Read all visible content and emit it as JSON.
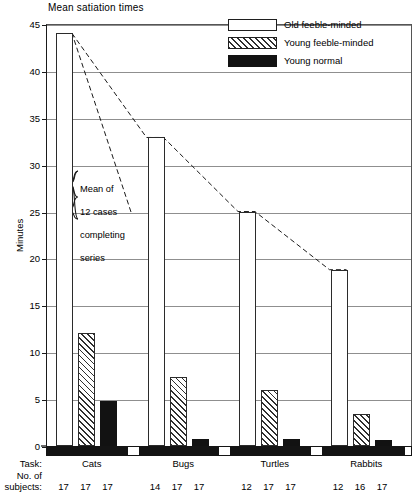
{
  "chart_data": {
    "type": "bar",
    "title": "Mean satiation times",
    "xlabel": "Task:",
    "ylabel": "Minutes",
    "ylim": [
      0,
      45
    ],
    "ytick_step": 5,
    "yticks": [
      "0",
      "5",
      "10",
      "15",
      "20",
      "25",
      "30",
      "35",
      "40",
      "45"
    ],
    "grid": true,
    "legend_position": "top-right",
    "categories": [
      "Cats",
      "Bugs",
      "Turtles",
      "Rabbits"
    ],
    "series": [
      {
        "name": "Old feeble-minded",
        "key": "old",
        "values": [
          44.0,
          32.9,
          25.0,
          18.8
        ],
        "subjects": [
          17,
          14,
          12,
          12
        ]
      },
      {
        "name": "Young feeble-minded",
        "key": "young-fm",
        "values": [
          12.1,
          7.4,
          6.0,
          3.4
        ],
        "subjects": [
          17,
          17,
          17,
          16
        ]
      },
      {
        "name": "Young normal",
        "key": "young-norm",
        "values": [
          4.8,
          0.8,
          0.8,
          0.6
        ],
        "subjects": [
          17,
          17,
          17,
          17
        ]
      }
    ],
    "annotations": [
      {
        "text": "Mean of\n12 cases\ncompleting\nseries",
        "points_to": "trend-line"
      }
    ],
    "trend_line": {
      "style": "dashed",
      "connects": "Old feeble-minded bar tops",
      "values": [
        44.0,
        32.9,
        25.0,
        18.8
      ]
    }
  },
  "axis": {
    "task_row_label": "Task:",
    "subjects_row_label_line1": "No. of",
    "subjects_row_label_line2": "subjects:"
  },
  "legend": {
    "items": [
      {
        "label": "Old feeble-minded",
        "swatch": "white-outline"
      },
      {
        "label": "Young feeble-minded",
        "swatch": "hatched"
      },
      {
        "label": "Young normal",
        "swatch": "solid-black"
      }
    ]
  },
  "annotation": {
    "line1": "Mean of",
    "line2": "12 cases",
    "line3": "completing",
    "line4": "series"
  }
}
